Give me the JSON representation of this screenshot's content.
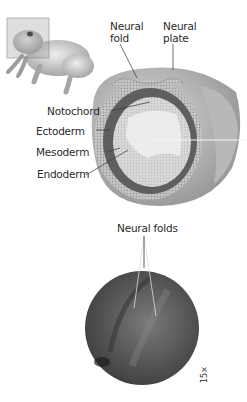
{
  "figure": {
    "top_panel": {
      "labels": {
        "neural_fold": "Neural\nfold",
        "neural_fold_line1": "Neural",
        "neural_fold_line2": "fold",
        "neural_plate_line1": "Neural",
        "neural_plate_line2": "plate",
        "notochord": "Notochord",
        "ectoderm": "Ectoderm",
        "mesoderm": "Mesoderm",
        "endoderm": "Endoderm"
      },
      "illustration": "frog-with-section-plane"
    },
    "bottom_panel": {
      "label": "Neural folds",
      "magnification": "15×"
    },
    "colors": {
      "background": "#ffffff",
      "text": "#2a2a2a",
      "embryo_outer": "#bdbdbd",
      "ectoderm_band": "#6e6e6e",
      "interior": "#e4e4e4",
      "micrograph": "#555555"
    }
  }
}
